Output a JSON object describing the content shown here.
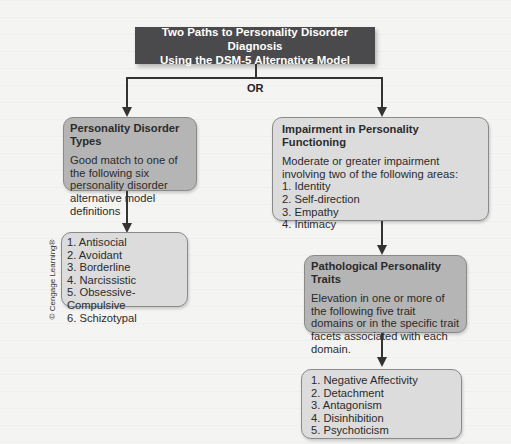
{
  "title": {
    "line1": "Two Paths to Personality Disorder Diagnosis",
    "line2": "Using the DSM-5 Alternative Model"
  },
  "connector_label": "OR",
  "left_path": {
    "types_box": {
      "header": "Personality Disorder Types",
      "body": "Good match to one of the following six personality disorder alternative model definitions"
    },
    "types_list": [
      "1. Antisocial",
      "2. Avoidant",
      "3. Borderline",
      "4. Narcissistic",
      "5. Obsessive-Compulsive",
      "6. Schizotypal"
    ]
  },
  "right_path": {
    "impairment_box": {
      "header": "Impairment in Personality Functioning",
      "body": "Moderate or greater impairment involving two of the following areas:",
      "items": [
        "1. Identity",
        "2. Self-direction",
        "3. Empathy",
        "4. Intimacy"
      ]
    },
    "traits_box": {
      "header": "Pathological Personality Traits",
      "body": "Elevation in one or more of the following five trait domains or in the specific trait facets associated with each domain."
    },
    "traits_list": [
      "1. Negative Affectivity",
      "2. Detachment",
      "3. Antagonism",
      "4. Disinhibition",
      "5. Psychoticism"
    ]
  },
  "copyright": "© Cengage Learning®",
  "colors": {
    "title_bg": "#4a4a4c",
    "dark_box": "#b5b5b5",
    "light_box": "#dcdcdc",
    "lines": "#333333"
  }
}
